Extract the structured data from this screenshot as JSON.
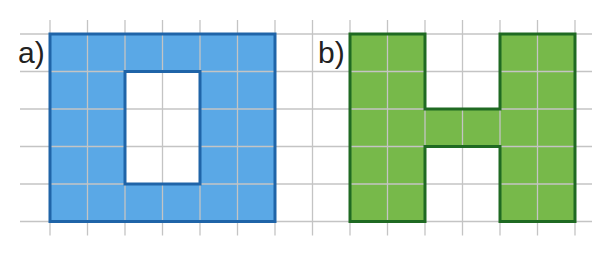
{
  "grid": {
    "cell": 37.5,
    "origin_x": 50,
    "origin_y": 34,
    "cols_left": -1,
    "cols_right": 15,
    "rows_top": -1,
    "rows_bottom": 5,
    "line_color": "#c4c4c4"
  },
  "figures": [
    {
      "id": "a",
      "label": "a)",
      "fill": "#5aa8e6",
      "stroke": "#1f64a8",
      "outer": {
        "col": 0,
        "row": 0,
        "w": 6,
        "h": 5
      },
      "hole": {
        "col": 2,
        "row": 1,
        "w": 2,
        "h": 3
      }
    },
    {
      "id": "b",
      "label": "b)",
      "fill": "#77b94a",
      "stroke": "#1f6a22",
      "polygon_cells": [
        [
          8,
          0
        ],
        [
          10,
          0
        ],
        [
          10,
          2
        ],
        [
          12,
          2
        ],
        [
          12,
          0
        ],
        [
          14,
          0
        ],
        [
          14,
          5
        ],
        [
          12,
          5
        ],
        [
          12,
          3
        ],
        [
          10,
          3
        ],
        [
          10,
          5
        ],
        [
          8,
          5
        ]
      ]
    }
  ]
}
